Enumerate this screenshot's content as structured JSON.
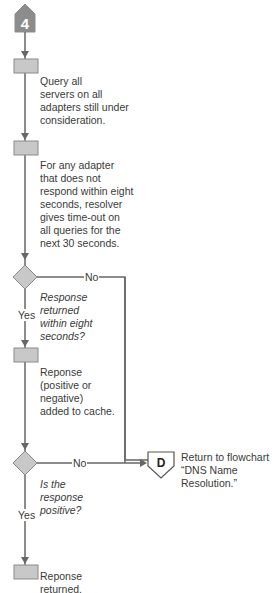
{
  "start_connector": {
    "label": "4"
  },
  "end_connector": {
    "label": "D",
    "text_line1": "Return to flowchart",
    "text_line2": "“DNS Name Resolution.”"
  },
  "steps": [
    {
      "type": "process",
      "text": [
        "Query all",
        "servers on all",
        "adapters still under",
        "consideration."
      ]
    },
    {
      "type": "process",
      "text": [
        "For any adapter",
        "that does not",
        "respond within eight",
        "seconds, resolver",
        "gives time-out on",
        "all queries for the",
        "next 30 seconds."
      ]
    },
    {
      "type": "decision",
      "text": [
        "Response",
        "returned",
        "within eight",
        "seconds?"
      ],
      "yes": "Yes",
      "no": "No"
    },
    {
      "type": "process",
      "text": [
        "Reponse",
        "(positive or",
        "negative)",
        "added to cache."
      ]
    },
    {
      "type": "decision",
      "text": [
        "Is the",
        "response",
        "positive?"
      ],
      "yes": "Yes",
      "no": "No"
    },
    {
      "type": "process",
      "text": [
        "Reponse",
        "returned."
      ]
    }
  ],
  "colors": {
    "shape_fill": "#c8c8c8",
    "shape_stroke": "#8a8a8a",
    "line": "#666666",
    "connector_fill": "#8c8c8c"
  }
}
